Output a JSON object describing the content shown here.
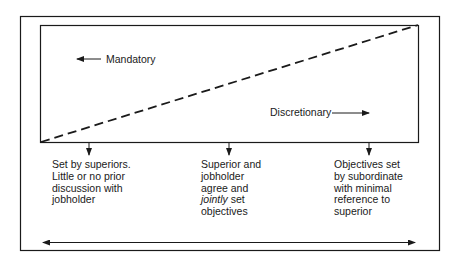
{
  "diagram": {
    "top_labels": {
      "mandatory": "Mandatory",
      "discretionary": "Discretionary"
    },
    "columns": [
      {
        "lines": [
          "Set by superiors.",
          "Little or no prior",
          "discussion with",
          "jobholder"
        ]
      },
      {
        "lines": [
          "Superior and",
          "jobholder",
          "agree and",
          "jointly",
          " set",
          "objectives"
        ],
        "line_1": "Superior and",
        "line_2": "jobholder",
        "line_3": "agree and",
        "line_4_italic": "jointly",
        "line_4_rest": " set",
        "line_5": "objectives"
      },
      {
        "lines": [
          "Objectives set",
          "by subordinate",
          "with minimal",
          "reference to",
          "superior"
        ]
      }
    ],
    "colors": {
      "ink": "#1a1a1a",
      "background": "#ffffff"
    }
  }
}
